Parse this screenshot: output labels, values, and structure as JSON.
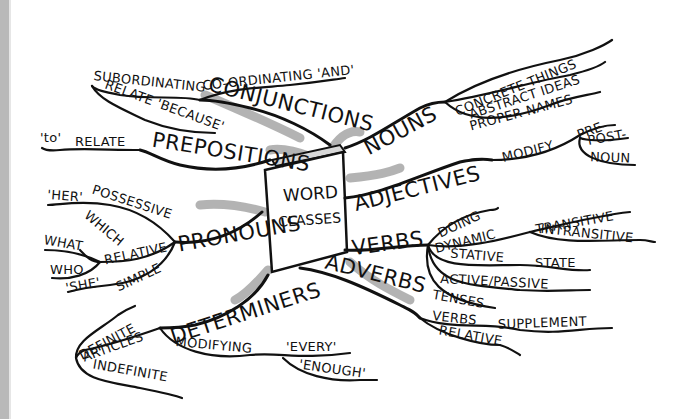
{
  "center": {
    "title": "WORD",
    "subtitle": "CLASSES"
  },
  "branches": {
    "nouns": {
      "label": "NOUNS",
      "children": [
        "CONCRETE THINGS",
        "ABSTRACT IDEAS",
        "PROPER NAMES"
      ]
    },
    "adjectives": {
      "label": "ADJECTIVES",
      "child": "MODIFY",
      "grandchildren": [
        "PRE-",
        "POST-",
        "NOUN"
      ]
    },
    "verbs": {
      "label": "VERBS",
      "doing": "DOING",
      "dynamic": "DYNAMIC",
      "dynamic_children": [
        "TRANSITIVE",
        "INTRANSITIVE"
      ],
      "stative": "STATIVE",
      "stative_child": "STATE",
      "voice": "ACTIVE/PASSIVE",
      "tenses": "TENSES"
    },
    "adverbs": {
      "label": "ADVERBS",
      "child": "VERBS",
      "child_child": "SUPPLEMENT",
      "relative": "RELATIVE"
    },
    "determiners": {
      "label": "DETERMINERS",
      "articles": "ARTICLES",
      "article_children": [
        "DEFINITE",
        "INDEFINITE"
      ],
      "modifying": "MODIFYING",
      "modifying_children": [
        "'EVERY'",
        "'ENOUGH'"
      ]
    },
    "pronouns": {
      "label": "PRONOUNS",
      "possessive": "POSSESSIVE",
      "possessive_example": "'HER'",
      "relative": "RELATIVE",
      "relative_children": [
        "WHICH",
        "WHAT",
        "WHO"
      ],
      "simple": "SIMPLE",
      "simple_example": "'SHE'"
    },
    "prepositions": {
      "label": "PREPOSITIONS",
      "child": "RELATE",
      "example": "'to'"
    },
    "conjunctions": {
      "label": "CONJUNCTIONS",
      "subordinating": "SUBORDINATING",
      "coordinating": "CO-ORDINATING 'AND'",
      "relate": "RELATE 'BECAUSE'"
    }
  }
}
